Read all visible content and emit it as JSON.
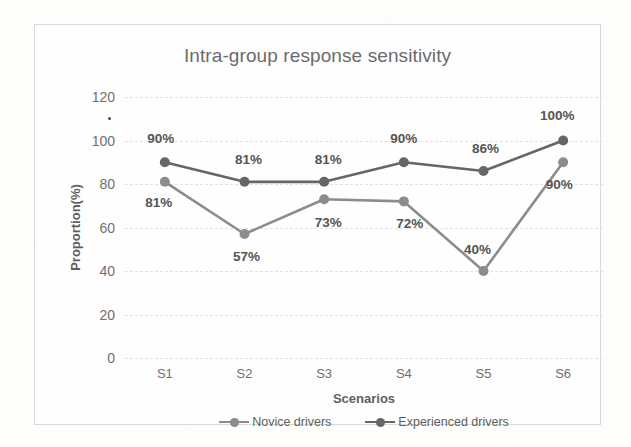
{
  "chart_data": {
    "type": "line",
    "title": "Intra-group response sensitivity",
    "xlabel": "Scenarios",
    "ylabel": "Proportion(%)",
    "categories": [
      "S1",
      "S2",
      "S3",
      "S4",
      "S5",
      "S6"
    ],
    "ylim": [
      0,
      120
    ],
    "yticks": [
      0,
      20,
      40,
      60,
      80,
      100,
      120
    ],
    "ytick_labels": [
      "0",
      "20",
      "40",
      "60",
      "80",
      "100",
      "120"
    ],
    "grid": true,
    "legend_position": "bottom",
    "series": [
      {
        "name": "Novice drivers",
        "color": "#8c8c8c",
        "values": [
          81,
          57,
          73,
          72,
          40,
          90
        ],
        "data_labels": [
          "81%",
          "57%",
          "73%",
          "72%",
          "40%",
          "90%"
        ],
        "label_offsets": [
          {
            "dx": -6,
            "dy": 20
          },
          {
            "dx": 2,
            "dy": 22
          },
          {
            "dx": 4,
            "dy": 23
          },
          {
            "dx": 6,
            "dy": 22
          },
          {
            "dx": -6,
            "dy": -22
          },
          {
            "dx": -4,
            "dy": 22
          }
        ]
      },
      {
        "name": "Experienced drivers",
        "color": "#666666",
        "values": [
          90,
          81,
          81,
          90,
          86,
          100
        ],
        "data_labels": [
          "90%",
          "81%",
          "81%",
          "90%",
          "86%",
          "100%"
        ],
        "label_offsets": [
          {
            "dx": -4,
            "dy": -24
          },
          {
            "dx": 4,
            "dy": -23
          },
          {
            "dx": 4,
            "dy": -23
          },
          {
            "dx": 0,
            "dy": -24
          },
          {
            "dx": 2,
            "dy": -23
          },
          {
            "dx": -6,
            "dy": -26
          }
        ]
      }
    ]
  }
}
